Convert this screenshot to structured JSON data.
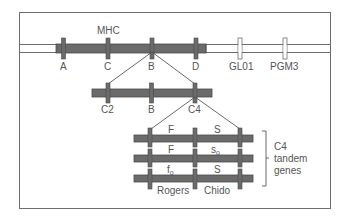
{
  "colors": {
    "frame": "#6e6e6e",
    "bar_gray": "#6b6b6b",
    "bar_stroke": "#4a4a4a",
    "bar_white": "#ffffff",
    "text": "#555555",
    "line": "#444444"
  },
  "title": "MHC",
  "chromosome": {
    "markers": [
      {
        "id": "A",
        "label": "A"
      },
      {
        "id": "C",
        "label": "C"
      },
      {
        "id": "B",
        "label": "B"
      },
      {
        "id": "D",
        "label": "D"
      },
      {
        "id": "GL01",
        "label": "GL01"
      },
      {
        "id": "PGM3",
        "label": "PGM3"
      }
    ]
  },
  "class3_region": {
    "markers": [
      {
        "id": "C2",
        "label": "C2"
      },
      {
        "id": "B",
        "label": "B"
      },
      {
        "id": "C4",
        "label": "C4"
      }
    ]
  },
  "c4_tandem": {
    "rows": [
      {
        "left": "F",
        "right": "S",
        "left_sub": "",
        "right_sub": ""
      },
      {
        "left": "F",
        "right": "s",
        "left_sub": "",
        "right_sub": "o"
      },
      {
        "left": "f",
        "right": "S",
        "left_sub": "o",
        "right_sub": ""
      }
    ],
    "bottom_labels": {
      "left": "Rogers",
      "right": "Chido"
    },
    "bracket_label": [
      "C4",
      "tandem",
      "genes"
    ]
  }
}
